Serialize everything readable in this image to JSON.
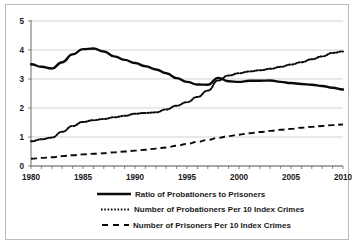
{
  "chart_data": {
    "type": "line",
    "title": "",
    "subtitle": "",
    "xlabel": "",
    "ylabel": "",
    "xlim": [
      1980,
      2010
    ],
    "ylim": [
      0,
      5
    ],
    "grid": true,
    "legend_position": "bottom",
    "y_ticks": [
      "0",
      "1",
      "2",
      "3",
      "4",
      "5"
    ],
    "x_ticks": [
      "1980",
      "1985",
      "1990",
      "1995",
      "2000",
      "2005",
      "2010"
    ],
    "x_minor_tick_interval": 1,
    "x": [
      1980,
      1981,
      1982,
      1983,
      1984,
      1985,
      1986,
      1987,
      1988,
      1989,
      1990,
      1991,
      1992,
      1993,
      1994,
      1995,
      1996,
      1997,
      1998,
      1999,
      2000,
      2001,
      2002,
      2003,
      2004,
      2005,
      2006,
      2007,
      2008,
      2009,
      2010
    ],
    "series": [
      {
        "name": "Ratio of Probationers to Prisoners",
        "style": "solid",
        "color": "#0a0a0a",
        "values": [
          3.51,
          3.42,
          3.36,
          3.58,
          3.85,
          4.03,
          4.05,
          3.95,
          3.78,
          3.66,
          3.55,
          3.44,
          3.33,
          3.2,
          3.03,
          2.9,
          2.81,
          2.8,
          3.04,
          2.92,
          2.9,
          2.94,
          2.94,
          2.95,
          2.9,
          2.86,
          2.83,
          2.8,
          2.76,
          2.7,
          2.64
        ]
      },
      {
        "name": "Number of Probationers Per 10 Index Crimes",
        "style": "dotted",
        "color": "#0a0a0a",
        "values": [
          0.85,
          0.92,
          0.98,
          1.18,
          1.38,
          1.52,
          1.58,
          1.62,
          1.68,
          1.73,
          1.8,
          1.83,
          1.85,
          1.95,
          2.08,
          2.2,
          2.38,
          2.6,
          2.95,
          3.12,
          3.2,
          3.26,
          3.3,
          3.35,
          3.42,
          3.5,
          3.58,
          3.68,
          3.78,
          3.9,
          3.95
        ]
      },
      {
        "name": "Number of Prisoners Per 10 Index Crimes",
        "style": "dashed",
        "color": "#0a0a0a",
        "values": [
          0.25,
          0.28,
          0.3,
          0.34,
          0.37,
          0.4,
          0.42,
          0.44,
          0.47,
          0.5,
          0.53,
          0.56,
          0.6,
          0.64,
          0.7,
          0.76,
          0.83,
          0.9,
          0.97,
          1.03,
          1.08,
          1.13,
          1.17,
          1.21,
          1.25,
          1.28,
          1.32,
          1.35,
          1.38,
          1.41,
          1.43
        ]
      }
    ],
    "legend": [
      "Ratio of Probationers to Prisoners",
      "Number of Probationers Per 10 Index Crimes",
      "Number of Prisoners Per 10 Index Crimes"
    ]
  }
}
